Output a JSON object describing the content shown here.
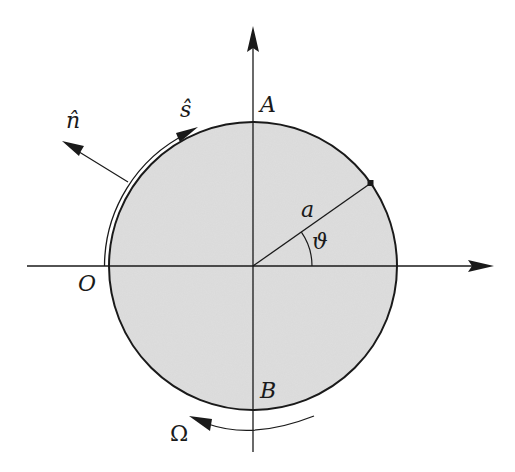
{
  "diagram": {
    "colors": {
      "disk_fill": "#dcdcdc",
      "stroke": "#1a1a1a",
      "background": "#ffffff"
    },
    "labels": {
      "top_point": "A",
      "bottom_point": "B",
      "origin_point": "O",
      "radius": "a",
      "angle": "ϑ",
      "normal_vector": "n̂",
      "tangent_vector": "ŝ",
      "rotation": "Ω"
    },
    "geometry": {
      "center": [
        253,
        266
      ],
      "radius": 144,
      "angle_deg": 35
    }
  }
}
